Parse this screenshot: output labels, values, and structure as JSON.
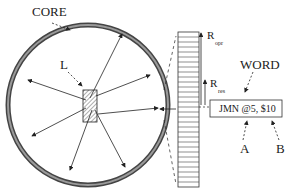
{
  "diagram": {
    "type": "memory-core-register-diagram",
    "labels": {
      "core": "CORE",
      "locator": "L",
      "word": "WORD",
      "r_opr_main": "R",
      "r_opr_sub": "opr",
      "r_res_main": "R",
      "r_res_sub": "res",
      "instruction": "JMN @5, $10",
      "operand_a": "A",
      "operand_b": "B"
    },
    "colors": {
      "ink": "#222222",
      "ring": "#555555",
      "ring_inner": "#888888",
      "background": "#ffffff"
    },
    "core_ring": {
      "cx": 88,
      "cy": 105,
      "r": 80
    },
    "register_column": {
      "x": 178,
      "y": 32,
      "width": 21,
      "height": 155,
      "cells": 31
    },
    "instruction_box": {
      "x": 210,
      "y": 100,
      "width": 72,
      "height": 17
    }
  }
}
